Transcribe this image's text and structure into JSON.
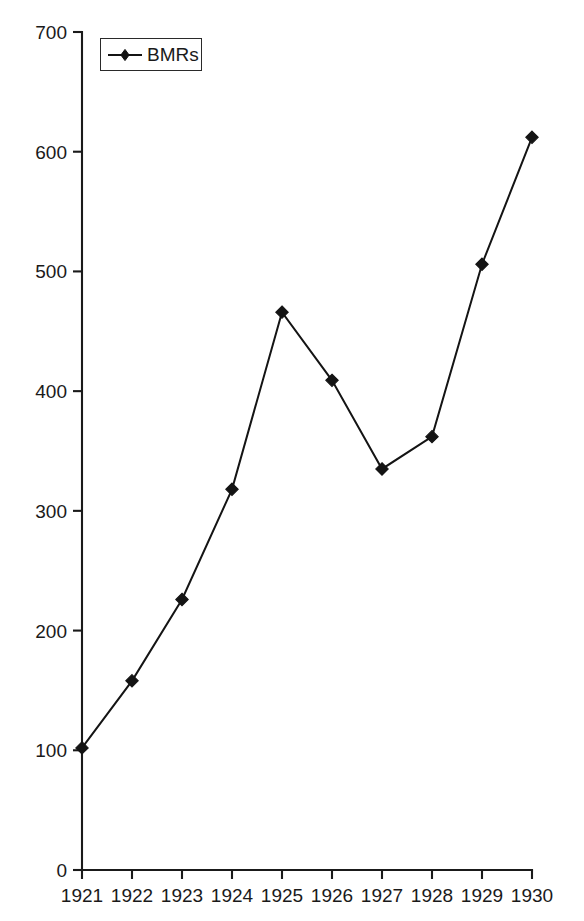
{
  "figure": {
    "clipped_title_remnant": "",
    "background_color": "#ffffff",
    "ink_color": "#141414"
  },
  "legend": {
    "position": "top-left-inside",
    "entries": [
      {
        "label": "BMRs",
        "marker": "diamond",
        "color": "#141414"
      }
    ],
    "bmrs_label": "BMRs"
  },
  "axes": {
    "y_ticks": [
      "0",
      "100",
      "200",
      "300",
      "400",
      "500",
      "600",
      "700"
    ],
    "x_ticks": [
      "1921",
      "1922",
      "1923",
      "1924",
      "1925",
      "1926",
      "1927",
      "1928",
      "1929",
      "1930"
    ],
    "y_axis_title": "",
    "x_axis_title": ""
  },
  "chart_data": {
    "type": "line",
    "title": "",
    "subtitle": "",
    "xlabel": "",
    "ylabel": "",
    "categories": [
      "1921",
      "1922",
      "1923",
      "1924",
      "1925",
      "1926",
      "1927",
      "1928",
      "1929",
      "1930"
    ],
    "series": [
      {
        "name": "BMRs",
        "color": "#141414",
        "marker": "diamond",
        "values": [
          102,
          158,
          226,
          318,
          466,
          409,
          335,
          362,
          506,
          612
        ]
      }
    ],
    "values": [
      102,
      158,
      226,
      318,
      466,
      409,
      335,
      362,
      506,
      612
    ],
    "ylim": [
      0,
      700
    ],
    "ytick_values": [
      0,
      100,
      200,
      300,
      400,
      500,
      600,
      700
    ],
    "xtick_values": [
      1921,
      1922,
      1923,
      1924,
      1925,
      1926,
      1927,
      1928,
      1929,
      1930
    ],
    "grid": false,
    "legend_position": "upper left",
    "annotations": []
  }
}
